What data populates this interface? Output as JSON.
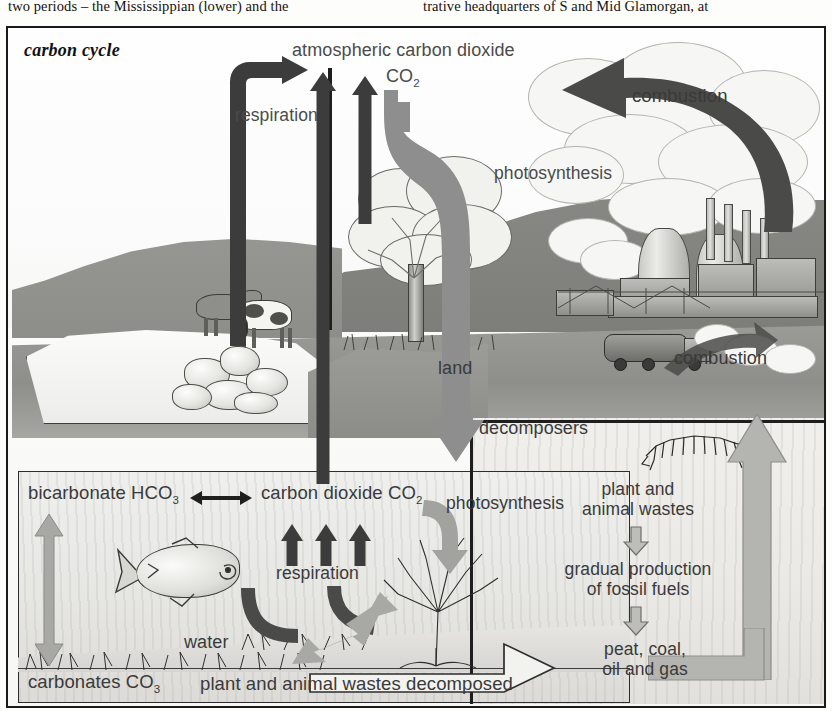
{
  "page": {
    "body_text_left": "two periods – the Mississippian (lower) and the",
    "body_text_right": "trative headquarters of S and Mid Glamorgan, at"
  },
  "figure": {
    "caption": "carbon cycle",
    "atmosphere": {
      "title": "atmospheric carbon dioxide",
      "formula_base": "CO",
      "formula_sub": "2"
    },
    "labels": {
      "respiration_air": "respiration",
      "photosynthesis_land": "photosynthesis",
      "combustion_power": "combustion",
      "combustion_truck": "combustion",
      "land": "land",
      "decomposers": "decomposers",
      "water": "water",
      "respiration_water": "respiration",
      "photosynthesis_water": "photosynthesis"
    },
    "sea_reaction": {
      "left_name": "bicarbonate HCO",
      "left_sub": "3",
      "arrow": "↔",
      "right_name": "carbon dioxide CO",
      "right_sub": "2"
    },
    "fossil_chain": [
      {
        "line1": "plant and",
        "line2": "animal wastes"
      },
      {
        "line1": "gradual production",
        "line2": "of fossil fuels"
      },
      {
        "line1": "peat, coal,",
        "line2": "oil and gas"
      }
    ],
    "bottom": {
      "carbonates_name": "carbonates CO",
      "carbonates_sub": "3",
      "decomposed": "plant and animal wastes decomposed"
    }
  },
  "colors": {
    "arrow_dark": "#3c3c3c",
    "arrow_mid": "#8e8e8e",
    "arrow_light": "#c9c9c6",
    "label_text": "#4b4b4b",
    "frame": "#1a1a1a",
    "land_dark": "#8b8b8b",
    "sea_fill": "#e6e6e3"
  }
}
